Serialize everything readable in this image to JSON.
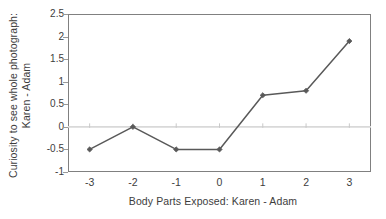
{
  "chart_data": {
    "type": "line",
    "title": "",
    "xlabel": "Body Parts Exposed: Karen - Adam",
    "ylabel_lines": [
      "Curiosity to see whole photograph:",
      "Karen - Adam"
    ],
    "x": [
      -3,
      -2,
      -1,
      0,
      1,
      2,
      3
    ],
    "xtick_labels": [
      "-3",
      "-2",
      "-1",
      "0",
      "1",
      "2",
      "3"
    ],
    "values": [
      -0.5,
      0,
      -0.5,
      -0.5,
      0.7,
      0.8,
      1.9
    ],
    "series": [
      {
        "name": "Curiosity to see whole photograph: Karen - Adam",
        "values": [
          -0.5,
          0,
          -0.5,
          -0.5,
          0.7,
          0.8,
          1.9
        ]
      }
    ],
    "ylim": [
      -1,
      2.5
    ],
    "xlim": [
      -3.5,
      3.5
    ],
    "ytick_values": [
      2.5,
      2,
      1.5,
      1,
      0.5,
      0,
      -0.5,
      -1
    ],
    "ytick_labels": [
      "2.5",
      "2",
      "1.5",
      "1",
      "0.5",
      "0",
      "-0.5",
      "-1"
    ],
    "grid": "zero-line-only",
    "legend": "none",
    "marker": "diamond",
    "colors": {
      "line": "#595959",
      "marker": "#595959",
      "zero_line": "#d9d9d9",
      "frame": "#808080",
      "text": "#3d3d3d",
      "background": "#ffffff"
    }
  }
}
